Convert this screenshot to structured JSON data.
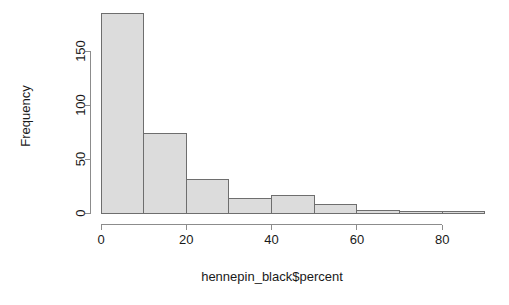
{
  "chart_data": {
    "type": "bar",
    "subtype": "histogram",
    "title": "",
    "xlabel": "hennepin_black$percent",
    "ylabel": "Frequency",
    "xlim": [
      0,
      90
    ],
    "ylim": [
      0,
      190
    ],
    "grid": false,
    "legend": false,
    "bin_width": 10,
    "bin_edges": [
      0,
      10,
      20,
      30,
      40,
      50,
      60,
      70,
      80,
      90
    ],
    "categories": [
      "0-10",
      "10-20",
      "20-30",
      "30-40",
      "40-50",
      "50-60",
      "60-70",
      "70-80",
      "80-90"
    ],
    "values": [
      185,
      74,
      31,
      13,
      16,
      8,
      2,
      1,
      1
    ],
    "xticks": [
      0,
      20,
      40,
      60,
      80
    ],
    "xtick_labels": [
      "0",
      "20",
      "40",
      "60",
      "80"
    ],
    "yticks": [
      0,
      50,
      100,
      150
    ],
    "ytick_labels": [
      "0",
      "50",
      "100",
      "150"
    ],
    "colors": {
      "bar_fill": "#dcdcdc",
      "bar_border": "#6e6e6e",
      "axis": "#8c8c8c",
      "text": "#1a1a1a",
      "background": "#ffffff"
    }
  }
}
